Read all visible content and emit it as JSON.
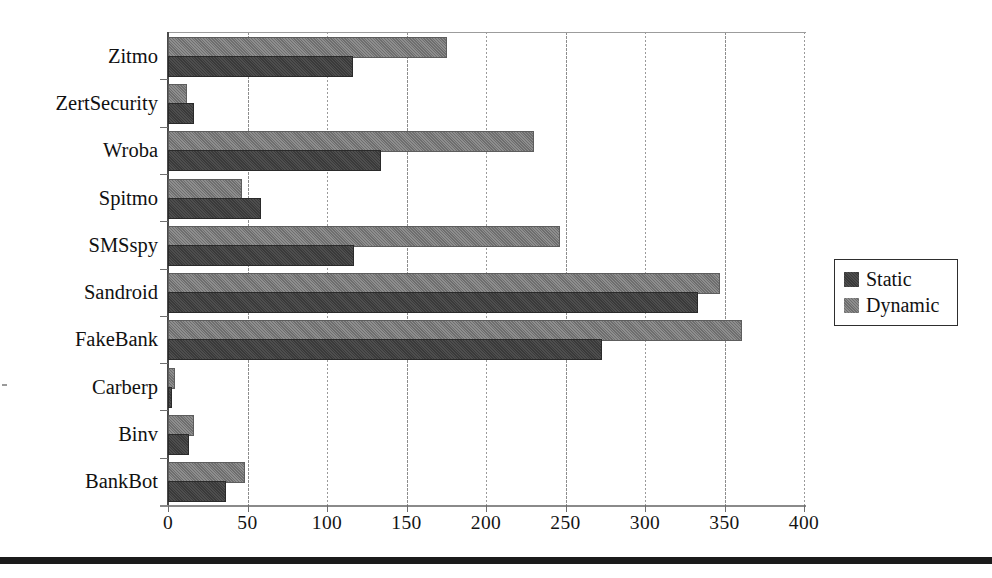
{
  "chart_data": {
    "type": "bar",
    "orientation": "horizontal",
    "title": "",
    "xlabel": "",
    "ylabel": "",
    "xlim": [
      0,
      400
    ],
    "xticks": [
      0,
      50,
      100,
      150,
      200,
      250,
      300,
      350,
      400
    ],
    "xtick_labels": [
      "0",
      "50",
      "100",
      "150",
      "200",
      "250",
      "300",
      "350",
      "400"
    ],
    "grid": "vertical-dotted",
    "legend_position": "right",
    "categories": [
      "Zitmo",
      "ZertSecurity",
      "Wroba",
      "Spitmo",
      "SMSspy",
      "Sandroid",
      "FakeBank",
      "Carberp",
      "Binv",
      "BankBot"
    ],
    "series": [
      {
        "name": "Static",
        "color": "#3a3a3a",
        "values": [
          115,
          15,
          133,
          57,
          116,
          332,
          272,
          1,
          12,
          35
        ]
      },
      {
        "name": "Dynamic",
        "color": "#6e6e6e",
        "values": [
          174,
          11,
          229,
          45,
          245,
          346,
          360,
          3,
          15,
          47
        ]
      }
    ]
  },
  "legend": {
    "entries": [
      {
        "label": "Static",
        "swatch": "static"
      },
      {
        "label": "Dynamic",
        "swatch": "dynamic"
      }
    ]
  }
}
